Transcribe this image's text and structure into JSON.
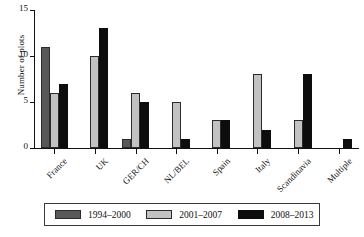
{
  "chart_data": {
    "type": "bar",
    "title": "",
    "xlabel": "",
    "ylabel": "Number of plots",
    "ylim": [
      0,
      15
    ],
    "yticks": [
      0,
      5,
      10,
      15
    ],
    "grid": false,
    "legend_position": "bottom",
    "categories": [
      "France",
      "UK",
      "GER/CH",
      "NL/BEL",
      "Spain",
      "Italy",
      "Scandinavia",
      "Multiple"
    ],
    "series": [
      {
        "name": "1994–2000",
        "color": "#585858",
        "values": [
          11,
          0,
          1,
          0,
          0,
          0,
          0,
          0
        ]
      },
      {
        "name": "2001–2007",
        "color": "#c2c2c2",
        "values": [
          6,
          10,
          6,
          5,
          3,
          8,
          3,
          0
        ]
      },
      {
        "name": "2008–2013",
        "color": "#0d0d0d",
        "values": [
          7,
          13,
          5,
          1,
          3,
          2,
          8,
          1
        ]
      }
    ]
  },
  "axis": {
    "y_title": "Number of plots",
    "y_tick_labels": [
      "0",
      "5",
      "10",
      "15"
    ],
    "x_tick_labels": [
      "France",
      "UK",
      "GER/CH",
      "NL/BEL",
      "Spain",
      "Italy",
      "Scandinavia",
      "Multiple"
    ]
  },
  "legend": {
    "entries": [
      {
        "label": "1994–2000",
        "color": "#585858"
      },
      {
        "label": "2001–2007",
        "color": "#c2c2c2"
      },
      {
        "label": "2008–2013",
        "color": "#0d0d0d"
      }
    ]
  }
}
